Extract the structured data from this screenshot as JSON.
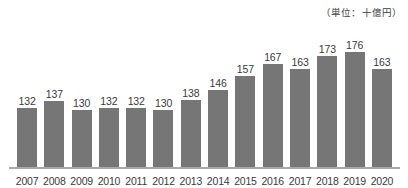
{
  "chart_data": {
    "type": "bar",
    "title": "",
    "subtitle": "",
    "unit_label": "（単位：十億円）",
    "xlabel": "",
    "ylabel": "",
    "grid": false,
    "legend": null,
    "axis_visible": {
      "x": true,
      "y": false
    },
    "value_labels_shown": true,
    "categories": [
      "2007",
      "2008",
      "2009",
      "2010",
      "2011",
      "2012",
      "2013",
      "2014",
      "2015",
      "2016",
      "2017",
      "2018",
      "2019",
      "2020"
    ],
    "values": [
      132,
      137,
      130,
      132,
      132,
      130,
      138,
      146,
      157,
      167,
      163,
      173,
      176,
      163
    ],
    "ylim": [
      84,
      181
    ],
    "colors": {
      "bar": "#767676",
      "text": "#3a3a3a",
      "axis": "#a8a8a8",
      "background": "#ffffff"
    }
  },
  "points": [
    {
      "category": "2007",
      "value": "132"
    },
    {
      "category": "2008",
      "value": "137"
    },
    {
      "category": "2009",
      "value": "130"
    },
    {
      "category": "2010",
      "value": "132"
    },
    {
      "category": "2011",
      "value": "132"
    },
    {
      "category": "2012",
      "value": "130"
    },
    {
      "category": "2013",
      "value": "138"
    },
    {
      "category": "2014",
      "value": "146"
    },
    {
      "category": "2015",
      "value": "157"
    },
    {
      "category": "2016",
      "value": "167"
    },
    {
      "category": "2017",
      "value": "163"
    },
    {
      "category": "2018",
      "value": "173"
    },
    {
      "category": "2019",
      "value": "176"
    },
    {
      "category": "2020",
      "value": "163"
    }
  ]
}
